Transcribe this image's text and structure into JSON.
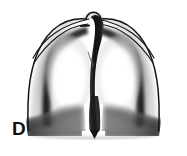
{
  "figure": {
    "panel_label": "D",
    "type": "grayscale-anatomical-illustration",
    "background_color": "#ffffff",
    "ink_color": "#101010",
    "mid_tone_color": "#6a6a6a",
    "light_tone_color": "#cfcfcf",
    "parts": [
      {
        "name": "outer-contour",
        "description": "thin dome-shaped outer body outline with apex bump at top center"
      },
      {
        "name": "apex-bump",
        "description": "small rounded peak at top center of the outer contour"
      },
      {
        "name": "left-upper-thin-line",
        "description": "thin curved line sweeping from apex down to the left shoulder"
      },
      {
        "name": "right-upper-thin-line",
        "description": "thin curved line sweeping from apex down to the right shoulder"
      },
      {
        "name": "apex-dash-mark",
        "description": "short horizontal dark dash just below and left of apex"
      },
      {
        "name": "left-dark-arc",
        "description": "thick dark arc with soft inward gradient along the left field"
      },
      {
        "name": "right-dark-arc",
        "description": "thick dark arc with soft inward gradient along the right field"
      },
      {
        "name": "central-dark-band",
        "description": "broad near-black vertical band running from apex to lower center, widening below"
      },
      {
        "name": "thin-diagonal-line",
        "description": "faint short diagonal line left of the central band in the upper-middle field"
      },
      {
        "name": "left-lower-lobe",
        "description": "dark shaded shoulder-shaped mass at lower left with sloping upper edge"
      },
      {
        "name": "right-lower-lobe",
        "description": "dark shaded shoulder-shaped mass at lower right with sloping upper edge"
      },
      {
        "name": "central-notch",
        "description": "white gap at the bottom center flanking the dark central column"
      },
      {
        "name": "bottom-point",
        "description": "small dark pointed tip at the base of the central column"
      }
    ]
  }
}
